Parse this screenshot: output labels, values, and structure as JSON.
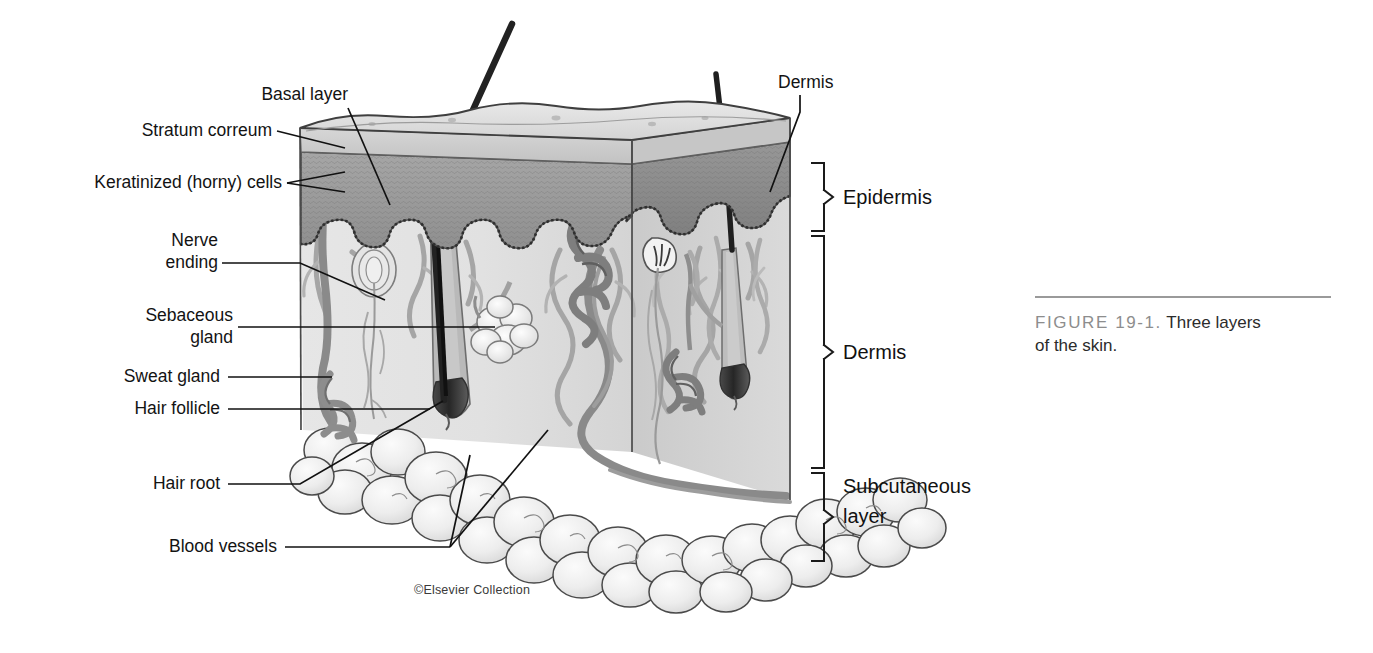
{
  "figure": {
    "number_label": "FIGURE 19-1.",
    "caption_text": "Three layers",
    "caption_text2": "of the skin.",
    "credit": "©Elsevier Collection",
    "rule_color": "#9a9a9a",
    "number_color": "#8d8d8d"
  },
  "labels": {
    "basal_layer": "Basal layer",
    "stratum_corneum": "Stratum correum",
    "keratinized": "Keratinized (horny) cells",
    "nerve_ending_1": "Nerve",
    "nerve_ending_2": "ending",
    "sebaceous_1": "Sebaceous",
    "sebaceous_2": "gland",
    "sweat_gland": "Sweat gland",
    "hair_follicle": "Hair follicle",
    "hair_root": "Hair root",
    "blood_vessels": "Blood vessels",
    "dermis_top": "Dermis"
  },
  "layer_brackets": [
    {
      "name": "Epidermis",
      "label": "Epidermis",
      "top": 163,
      "bottom": 231
    },
    {
      "name": "Dermis",
      "label": "Dermis",
      "top": 236,
      "bottom": 468
    },
    {
      "name": "Subcutaneous layer",
      "label": "Subcutaneous",
      "label2": "layer",
      "top": 473,
      "bottom": 561
    }
  ],
  "colors": {
    "ink": "#1a1a1a",
    "top_surface": "#dedede",
    "stratum_band": "#cfcfcf",
    "epidermis_band": "#9b9b9b",
    "dermis_face": "#e3e3e3",
    "dermis_side": "#c9c9c9",
    "fat_lobule": "#ececec",
    "vessel": "#8e8e8e",
    "hair": "#2b2b2b",
    "outline": "#3c3c3c"
  },
  "structures": [
    "stratum corneum",
    "keratinized horny cells",
    "basal layer",
    "nerve ending",
    "sebaceous gland",
    "sweat gland",
    "hair follicle",
    "hair root",
    "hair shaft",
    "blood vessels",
    "subcutaneous fat lobules"
  ]
}
